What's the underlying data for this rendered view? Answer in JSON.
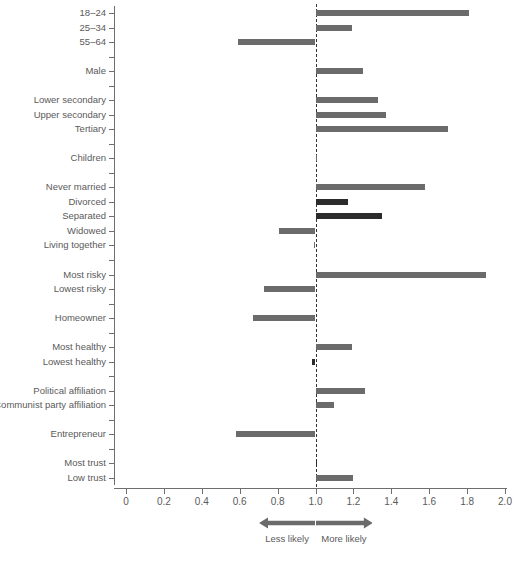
{
  "chart_data": {
    "type": "bar",
    "orientation": "horizontal",
    "title": "",
    "xlabel": "",
    "ylabel": "",
    "xlim": [
      0,
      2.0
    ],
    "xticks": [
      "0",
      "0.2",
      "0.4",
      "0.6",
      "0.8",
      "1.0",
      "1.2",
      "1.4",
      "1.6",
      "1.8",
      "2.0"
    ],
    "xtick_values": [
      0,
      0.2,
      0.4,
      0.6,
      0.8,
      1.0,
      1.2,
      1.4,
      1.6,
      1.8,
      2.0
    ],
    "reference_line": 1.0,
    "grid": false,
    "legend": null,
    "baseline_note": "Bars are odds ratios drawn from the reference value of 1.0",
    "annotations": [
      {
        "text": "Less likely",
        "from": 0.7,
        "to": 1.0,
        "direction": "left"
      },
      {
        "text": "More likely",
        "from": 1.0,
        "to": 1.3,
        "direction": "right"
      }
    ],
    "colors": {
      "bar_default": "#6b6b6b",
      "bar_highlight": "#2b2b2b",
      "axis": "#6f6f6f",
      "reference_line": "#333333",
      "text": "#5a5a5a"
    },
    "categories": [
      "18–24",
      "25–34",
      "55–64",
      "",
      "Male",
      "",
      "Lower secondary",
      "Upper secondary",
      "Tertiary",
      "",
      "Children",
      "",
      "Never married",
      "Divorced",
      "Separated",
      "Widowed",
      "Living together",
      "",
      "Most risky",
      "Lowest risky",
      "",
      "Homeowner",
      "",
      "Most healthy",
      "Lowest healthy",
      "",
      "Political affiliation",
      "Communist party affiliation",
      "",
      "Entrepreneur",
      "",
      "Most trust",
      "Low trust"
    ],
    "values": [
      1.81,
      1.19,
      0.59,
      null,
      1.25,
      null,
      1.33,
      1.37,
      1.7,
      null,
      1.0,
      null,
      1.58,
      1.17,
      1.35,
      0.81,
      0.99,
      null,
      1.9,
      0.73,
      null,
      0.67,
      null,
      1.19,
      0.98,
      null,
      1.26,
      1.1,
      null,
      0.58,
      null,
      1.0,
      1.2
    ],
    "highlighted": [
      "Divorced",
      "Separated",
      "Lowest healthy",
      "Most trust"
    ],
    "points": [
      {
        "label": "18–24",
        "value": 1.81,
        "highlight": false
      },
      {
        "label": "25–34",
        "value": 1.19,
        "highlight": false
      },
      {
        "label": "55–64",
        "value": 0.59,
        "highlight": false
      },
      {
        "label": "",
        "value": null,
        "highlight": false
      },
      {
        "label": "Male",
        "value": 1.25,
        "highlight": false
      },
      {
        "label": "",
        "value": null,
        "highlight": false
      },
      {
        "label": "Lower secondary",
        "value": 1.33,
        "highlight": false
      },
      {
        "label": "Upper secondary",
        "value": 1.37,
        "highlight": false
      },
      {
        "label": "Tertiary",
        "value": 1.7,
        "highlight": false
      },
      {
        "label": "",
        "value": null,
        "highlight": false
      },
      {
        "label": "Children",
        "value": 1.0,
        "highlight": false
      },
      {
        "label": "",
        "value": null,
        "highlight": false
      },
      {
        "label": "Never married",
        "value": 1.58,
        "highlight": false
      },
      {
        "label": "Divorced",
        "value": 1.17,
        "highlight": true
      },
      {
        "label": "Separated",
        "value": 1.35,
        "highlight": true
      },
      {
        "label": "Widowed",
        "value": 0.81,
        "highlight": false
      },
      {
        "label": "Living together",
        "value": 0.99,
        "highlight": false
      },
      {
        "label": "",
        "value": null,
        "highlight": false
      },
      {
        "label": "Most risky",
        "value": 1.9,
        "highlight": false
      },
      {
        "label": "Lowest risky",
        "value": 0.73,
        "highlight": false
      },
      {
        "label": "",
        "value": null,
        "highlight": false
      },
      {
        "label": "Homeowner",
        "value": 0.67,
        "highlight": false
      },
      {
        "label": "",
        "value": null,
        "highlight": false
      },
      {
        "label": "Most healthy",
        "value": 1.19,
        "highlight": false
      },
      {
        "label": "Lowest healthy",
        "value": 0.98,
        "highlight": true
      },
      {
        "label": "",
        "value": null,
        "highlight": false
      },
      {
        "label": "Political affiliation",
        "value": 1.26,
        "highlight": false
      },
      {
        "label": "Communist party affiliation",
        "value": 1.1,
        "highlight": false
      },
      {
        "label": "",
        "value": null,
        "highlight": false
      },
      {
        "label": "Entrepreneur",
        "value": 0.58,
        "highlight": false
      },
      {
        "label": "",
        "value": null,
        "highlight": false
      },
      {
        "label": "Most trust",
        "value": 1.0,
        "highlight": true
      },
      {
        "label": "Low trust",
        "value": 1.2,
        "highlight": false
      }
    ]
  }
}
